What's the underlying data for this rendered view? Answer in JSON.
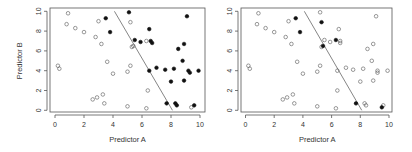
{
  "chart_data": [
    {
      "type": "scatter",
      "title": "",
      "xlabel": "Predictor A",
      "ylabel": "Predictor B",
      "xlim": [
        0,
        10
      ],
      "ylim": [
        0,
        10
      ],
      "xticks": [
        "0",
        "2",
        "4",
        "6",
        "8",
        "10"
      ],
      "yticks": [
        "0",
        "2",
        "4",
        "6",
        "8",
        "10"
      ],
      "grid": false,
      "legend": null,
      "decision_line": {
        "x1": 4.1,
        "y1": 10,
        "x2": 8.1,
        "y2": 0
      },
      "series": [
        {
          "name": "open",
          "marker": "open-circle",
          "points": [
            [
              0.2,
              4.5
            ],
            [
              0.3,
              4.2
            ],
            [
              0.9,
              9.8
            ],
            [
              0.8,
              8.7
            ],
            [
              1.4,
              8.3
            ],
            [
              2.0,
              7.9
            ],
            [
              2.8,
              7.4
            ],
            [
              3.0,
              9.0
            ],
            [
              3.2,
              6.7
            ],
            [
              3.6,
              4.9
            ],
            [
              4.0,
              3.7
            ],
            [
              2.6,
              1.1
            ],
            [
              2.9,
              1.3
            ],
            [
              3.3,
              1.6
            ],
            [
              3.4,
              0.7
            ],
            [
              5.0,
              3.9
            ],
            [
              5.2,
              4.5
            ],
            [
              5.2,
              8.9
            ],
            [
              5.3,
              6.4
            ],
            [
              5.4,
              6.5
            ],
            [
              6.3,
              7.0
            ],
            [
              6.4,
              2.0
            ],
            [
              5.0,
              0.4
            ],
            [
              6.3,
              0.2
            ],
            [
              9.4,
              0.3
            ]
          ]
        },
        {
          "name": "filled",
          "marker": "filled-circle",
          "points": [
            [
              3.5,
              9.3
            ],
            [
              3.8,
              7.9
            ],
            [
              5.1,
              9.9
            ],
            [
              5.5,
              7.1
            ],
            [
              5.9,
              6.9
            ],
            [
              6.5,
              8.2
            ],
            [
              6.6,
              7.0
            ],
            [
              6.7,
              6.8
            ],
            [
              6.5,
              4.0
            ],
            [
              7.0,
              4.3
            ],
            [
              7.6,
              4.1
            ],
            [
              8.0,
              2.9
            ],
            [
              8.2,
              4.2
            ],
            [
              8.3,
              0.7
            ],
            [
              8.4,
              0.5
            ],
            [
              7.7,
              0.7
            ],
            [
              8.5,
              6.2
            ],
            [
              8.8,
              5.0
            ],
            [
              8.9,
              6.7
            ],
            [
              8.9,
              3.0
            ],
            [
              9.2,
              4.0
            ],
            [
              9.3,
              3.8
            ],
            [
              9.1,
              9.5
            ],
            [
              9.9,
              4.0
            ],
            [
              9.6,
              0.5
            ]
          ]
        }
      ]
    },
    {
      "type": "scatter",
      "title": "",
      "xlabel": "Predictor A",
      "ylabel": "",
      "xlim": [
        0,
        10
      ],
      "ylim": [
        0,
        10
      ],
      "xticks": [
        "0",
        "2",
        "4",
        "6",
        "8",
        "10"
      ],
      "yticks": [
        "0",
        "2",
        "4",
        "6",
        "8",
        "10"
      ],
      "grid": false,
      "legend": null,
      "decision_line": {
        "x1": 4.1,
        "y1": 10,
        "x2": 8.1,
        "y2": 0
      },
      "series": [
        {
          "name": "open",
          "marker": "open-circle",
          "points": [
            [
              0.2,
              4.5
            ],
            [
              0.3,
              4.2
            ],
            [
              0.9,
              9.8
            ],
            [
              0.8,
              8.7
            ],
            [
              1.4,
              8.3
            ],
            [
              2.0,
              7.9
            ],
            [
              2.8,
              7.4
            ],
            [
              3.0,
              9.0
            ],
            [
              3.2,
              6.7
            ],
            [
              3.6,
              4.9
            ],
            [
              4.0,
              3.7
            ],
            [
              2.6,
              1.1
            ],
            [
              2.9,
              1.3
            ],
            [
              3.3,
              1.6
            ],
            [
              3.4,
              0.7
            ],
            [
              5.0,
              3.9
            ],
            [
              5.2,
              4.5
            ],
            [
              5.2,
              9.9
            ],
            [
              5.3,
              6.4
            ],
            [
              5.5,
              7.1
            ],
            [
              5.9,
              6.9
            ],
            [
              6.5,
              8.2
            ],
            [
              6.6,
              7.0
            ],
            [
              6.6,
              6.8
            ],
            [
              6.4,
              4.0
            ],
            [
              6.4,
              2.0
            ],
            [
              7.0,
              4.3
            ],
            [
              7.5,
              4.1
            ],
            [
              8.0,
              2.9
            ],
            [
              8.2,
              4.2
            ],
            [
              8.3,
              0.7
            ],
            [
              8.4,
              0.5
            ],
            [
              8.5,
              6.2
            ],
            [
              8.8,
              5.0
            ],
            [
              8.9,
              6.7
            ],
            [
              8.9,
              3.0
            ],
            [
              9.2,
              4.0
            ],
            [
              9.2,
              3.8
            ],
            [
              9.1,
              9.5
            ],
            [
              9.9,
              4.0
            ],
            [
              9.6,
              0.5
            ],
            [
              5.0,
              0.4
            ],
            [
              6.3,
              0.2
            ]
          ]
        },
        {
          "name": "filled",
          "marker": "filled-circle",
          "points": [
            [
              3.5,
              9.3
            ],
            [
              3.8,
              7.9
            ],
            [
              5.3,
              8.9
            ],
            [
              5.4,
              6.5
            ],
            [
              6.3,
              7.1
            ],
            [
              7.7,
              0.7
            ],
            [
              9.5,
              0.3
            ]
          ]
        }
      ]
    }
  ]
}
